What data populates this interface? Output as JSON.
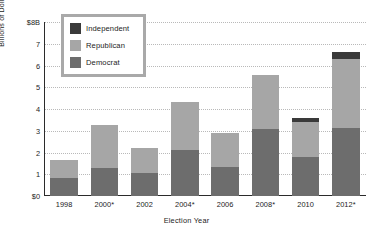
{
  "chart_data": {
    "type": "bar",
    "title": "",
    "xlabel": "Election Year",
    "ylabel": "Billions of Dollars",
    "categories": [
      "1998",
      "2000*",
      "2002",
      "2004*",
      "2006",
      "2008*",
      "2010",
      "2012*"
    ],
    "series": [
      {
        "name": "Democrat",
        "color": "#6d6d6d",
        "values": [
          0.82,
          1.28,
          1.05,
          2.1,
          1.33,
          3.1,
          1.8,
          3.15
        ]
      },
      {
        "name": "Republican",
        "color": "#a6a6a6",
        "values": [
          0.83,
          1.97,
          1.15,
          2.2,
          1.57,
          2.45,
          1.6,
          3.15
        ]
      },
      {
        "name": "Independent",
        "color": "#3a3a3a",
        "values": [
          0.0,
          0.0,
          0.0,
          0.0,
          0.0,
          0.0,
          0.18,
          0.3
        ]
      }
    ],
    "totals": [
      1.65,
      3.25,
      2.2,
      4.3,
      2.9,
      5.55,
      3.58,
      6.6
    ],
    "stacked": true,
    "stack_order_bottom_to_top": [
      "Democrat",
      "Republican",
      "Independent"
    ],
    "ylim": [
      0,
      8
    ],
    "yticks": [
      "$0",
      "1",
      "2",
      "3",
      "4",
      "5",
      "6",
      "7",
      "$8B"
    ],
    "ytick_values": [
      0,
      1,
      2,
      3,
      4,
      5,
      6,
      7,
      8
    ],
    "grid": true,
    "grid_style": "dotted-horizontal",
    "legend_position": "top-left-inside",
    "legend_entries": [
      "Independent",
      "Republican",
      "Democrat"
    ],
    "axis_color": "#2b2b2b",
    "grid_color": "#b9b9b9",
    "background": "#ffffff"
  },
  "legend": {
    "items": [
      {
        "label": "Independent",
        "swatch": "#3a3a3a"
      },
      {
        "label": "Republican",
        "swatch": "#a6a6a6"
      },
      {
        "label": "Democrat",
        "swatch": "#6d6d6d"
      }
    ]
  },
  "axes": {
    "y_title": "Billions of Dollars",
    "x_title": "Election Year"
  }
}
